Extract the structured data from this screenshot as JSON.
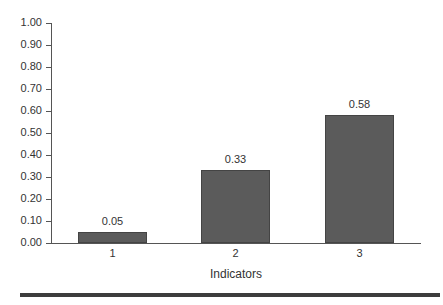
{
  "chart_data": {
    "type": "bar",
    "title": "",
    "xlabel": "Indicators",
    "ylabel": "",
    "categories": [
      "1",
      "2",
      "3"
    ],
    "values": [
      0.05,
      0.33,
      0.58
    ],
    "value_labels": [
      "0.05",
      "0.33",
      "0.58"
    ],
    "ylim": [
      0,
      1.0
    ],
    "yticks": [
      "1.00",
      "0.90",
      "0.80",
      "0.70",
      "0.60",
      "0.50",
      "0.40",
      "0.30",
      "0.20",
      "0.10",
      "0.00"
    ],
    "grid": false,
    "legend": null,
    "bar_color": "#5b5b5b"
  }
}
